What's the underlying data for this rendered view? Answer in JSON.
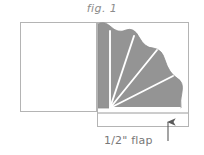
{
  "figure": {
    "title": "fig. 1",
    "caption": "1/2\" flap",
    "colors": {
      "background": "#ffffff",
      "panel_fill": "#ffffff",
      "panel_stroke": "#b4b4b4",
      "fan_fill": "#949494",
      "fan_stroke": "#8a8a8a",
      "fan_rays": "#ffffff",
      "text": "#8c8c8c",
      "caption_text": "#787878",
      "arrow": "#5a5a5a"
    },
    "panels": [
      {
        "name": "left-panel",
        "label": "",
        "x": 20,
        "y": 22,
        "width": 77,
        "height": 90
      },
      {
        "name": "right-panel",
        "label": "",
        "x": 97,
        "y": 22,
        "width": 92,
        "height": 105
      }
    ],
    "fold_line": {
      "x": 97,
      "y_top": 22,
      "y_bottom": 112
    },
    "flap_strip": {
      "x": 98,
      "y": 113,
      "width": 90,
      "height": 14,
      "measurement": "1/2\""
    },
    "fan": {
      "pivot_x": 110,
      "pivot_y": 108,
      "radius": 82,
      "scallop_lobes": 5,
      "ray_count": 5,
      "ray_angles_deg": [
        90,
        72,
        50,
        27,
        0
      ]
    },
    "arrow": {
      "name": "flap-pointer-arrow",
      "tip_x": 168,
      "tip_y": 124,
      "tail_y": 146,
      "direction": "up"
    }
  }
}
